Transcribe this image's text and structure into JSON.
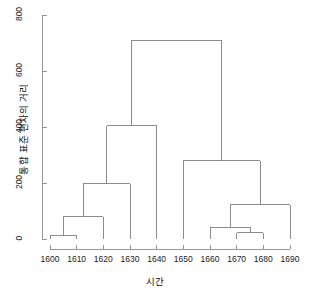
{
  "chart_data": {
    "type": "dendrogram",
    "title": "",
    "xlabel": "시간",
    "ylabel": "통합 표준 편차의 거리",
    "xlim": [
      1595,
      1695
    ],
    "ylim": [
      0,
      800
    ],
    "grid": false,
    "legend": null,
    "y_ticks": [
      0,
      200,
      400,
      600,
      800
    ],
    "y_tick_labels": [
      "0",
      "200",
      "400",
      "600",
      "800"
    ],
    "x_ticks": [
      1600,
      1610,
      1620,
      1630,
      1640,
      1650,
      1660,
      1670,
      1680,
      1690
    ],
    "x_tick_labels": [
      "1600",
      "1610",
      "1620",
      "1630",
      "1640",
      "1650",
      "1660",
      "1670",
      "1680",
      "1690"
    ],
    "leaves": [
      1600,
      1610,
      1620,
      1630,
      1640,
      1650,
      1660,
      1670,
      1680,
      1690
    ],
    "line_color": "#808080",
    "axis_color": "#8a8a8a",
    "merges": [
      {
        "id": "m1",
        "label": "1600-1610",
        "left": 1600,
        "right": 1610,
        "height": 12
      },
      {
        "id": "m2",
        "label": "m1-1620",
        "left": 1605,
        "right": 1620,
        "height": 80
      },
      {
        "id": "m3",
        "label": "m2-1630",
        "left": 1612.5,
        "right": 1630,
        "height": 197
      },
      {
        "id": "m4",
        "label": "m3-1640",
        "left": 1621.25,
        "right": 1640,
        "height": 405
      },
      {
        "id": "m5",
        "label": "1670-1680",
        "left": 1670,
        "right": 1680,
        "height": 22
      },
      {
        "id": "m6",
        "label": "1660-m5",
        "left": 1660,
        "right": 1675,
        "height": 42
      },
      {
        "id": "m7",
        "label": "m6-1690",
        "left": 1667.5,
        "right": 1690,
        "height": 122
      },
      {
        "id": "m8",
        "label": "1650-m7",
        "left": 1650,
        "right": 1678.75,
        "height": 280
      },
      {
        "id": "m9",
        "label": "root",
        "left": 1630.625,
        "right": 1664.375,
        "height": 710
      }
    ]
  }
}
